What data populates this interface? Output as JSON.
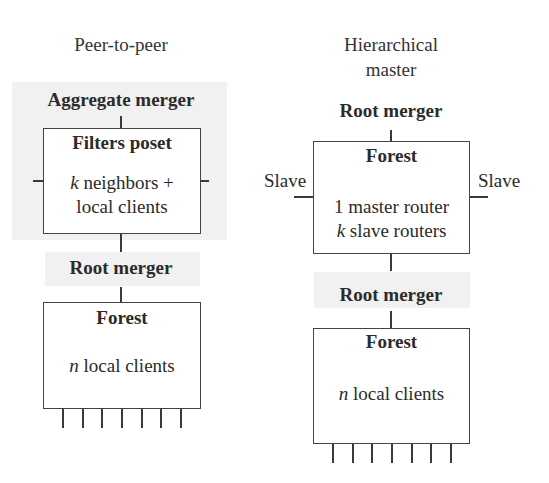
{
  "left": {
    "title": "Peer-to-peer",
    "top_label": "Aggregate merger",
    "box1": {
      "heading": "Filters poset",
      "line1_var": "k",
      "line1_rest": " neighbors +",
      "line2": "local clients"
    },
    "middle_label": "Root merger",
    "box2": {
      "heading": "Forest",
      "line1_var": "n",
      "line1_rest": " local clients"
    },
    "tick_count": 7
  },
  "right": {
    "title_line1": "Hierarchical",
    "title_line2": "master",
    "top_label": "Root merger",
    "box1": {
      "heading": "Forest",
      "line1": "1 master router",
      "line2_var": "k",
      "line2_rest": " slave routers"
    },
    "side_left": "Slave",
    "side_right": "Slave",
    "middle_label": "Root merger",
    "box2": {
      "heading": "Forest",
      "line1_var": "n",
      "line1_rest": " local clients"
    },
    "tick_count": 7
  }
}
